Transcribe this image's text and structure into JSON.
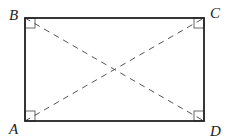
{
  "diagram": {
    "type": "rectangle-with-diagonals",
    "vertices": [
      {
        "label": "A",
        "position": "bottom-left"
      },
      {
        "label": "B",
        "position": "top-left"
      },
      {
        "label": "C",
        "position": "top-right"
      },
      {
        "label": "D",
        "position": "bottom-right"
      }
    ],
    "diagonals": [
      "AC",
      "BD"
    ],
    "diagonal_style": "dashed",
    "right_angle_marks": [
      "A",
      "B",
      "C",
      "D"
    ],
    "colors": {
      "stroke": "#222222",
      "dashed": "#555555",
      "background": "#ffffff"
    }
  }
}
